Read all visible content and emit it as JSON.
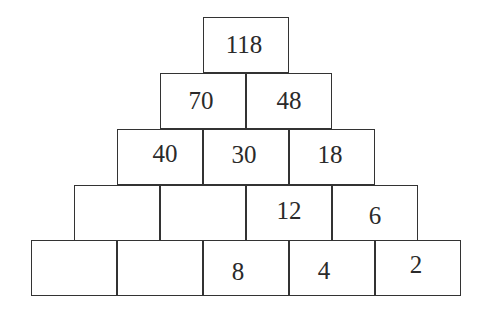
{
  "pyramid": {
    "rows": [
      {
        "cells": [
          "118"
        ]
      },
      {
        "cells": [
          "70",
          "48"
        ]
      },
      {
        "cells": [
          "40",
          "30",
          "18"
        ]
      },
      {
        "cells": [
          "",
          "",
          "12",
          "6"
        ]
      },
      {
        "cells": [
          "",
          "",
          "8",
          "4",
          "2"
        ]
      }
    ]
  },
  "layout": {
    "cell_width": 86,
    "cell_height": 56,
    "row_tops": [
      17,
      73,
      129,
      185,
      240
    ],
    "row_lefts": [
      203,
      160,
      117,
      74,
      31
    ],
    "text_offsets": {
      "0": [
        [
          -2,
          0
        ]
      ],
      "1": [
        [
          -2,
          0
        ],
        [
          0,
          0
        ]
      ],
      "2": [
        [
          -5,
          0
        ],
        [
          -2,
          0
        ],
        [
          -6,
          0
        ]
      ],
      "3": [
        [
          0,
          0
        ],
        [
          0,
          0
        ],
        [
          0,
          0
        ],
        [
          0,
          4
        ]
      ],
      "4": [
        [
          0,
          0
        ],
        [
          0,
          0
        ],
        [
          -9,
          3
        ],
        [
          -10,
          3
        ],
        [
          0,
          -3
        ]
      ]
    }
  },
  "colors": {
    "border": "#333333",
    "text": "#2a2a2a",
    "background": "#ffffff"
  }
}
